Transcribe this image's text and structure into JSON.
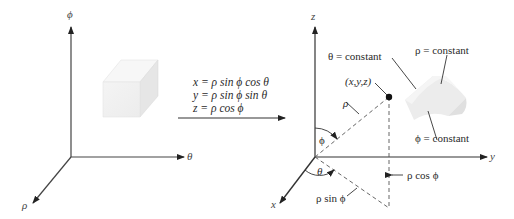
{
  "left_panel": {
    "axes": {
      "vertical": "ϕ",
      "horizontal": "θ",
      "depth": "ρ"
    }
  },
  "transformation": {
    "equations": [
      "x = ρ sin ϕ  cos θ",
      "y = ρ sin ϕ  sin θ",
      "z = ρ cos ϕ"
    ]
  },
  "right_panel": {
    "axes": {
      "vertical": "z",
      "horizontal": "y",
      "depth": "x"
    },
    "labels": {
      "theta_constant": "θ = constant",
      "rho_constant": "ρ = constant",
      "phi_constant": "ϕ = constant",
      "point": "(x,y,z)",
      "rho": "ρ",
      "phi_angle": "ϕ",
      "theta_angle": "θ",
      "rho_sin_phi": "ρ sin  ϕ",
      "rho_cos_phi": "ρ cos ϕ"
    }
  },
  "colors": {
    "line": "#333333",
    "dash": "#555555",
    "solid_fill": "#f1f1f1",
    "solid_shade": "#e2e2e2"
  }
}
